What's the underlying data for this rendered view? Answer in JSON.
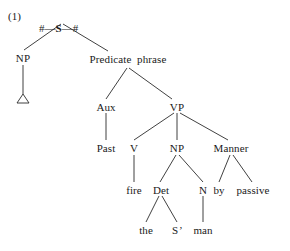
{
  "figure": {
    "number_label": "(1)",
    "root_text": "# — S — #",
    "root_left_boundary": "#",
    "root_symbol": "S",
    "root_right_boundary": "#",
    "dash": "—",
    "type": "syntax-tree",
    "background_color": "#ffffff",
    "line_color": "#2b2b2b",
    "text_color": "#1a1a1a"
  },
  "nodes": {
    "np_subject": "NP",
    "triangle": "△",
    "predicate_phrase": "Predicate  phrase",
    "aux": "Aux",
    "vp": "VP",
    "past": "Past",
    "v": "V",
    "np_object": "NP",
    "manner": "Manner",
    "fire": "fire",
    "det": "Det",
    "n": "N",
    "by": "by",
    "passive": "passive",
    "the": "the",
    "s_prime_s": "S",
    "s_prime_mark": "’",
    "man": "man"
  },
  "tree_structure": {
    "root": "# — S — #",
    "children": [
      {
        "label": "NP",
        "children": [
          {
            "label": "△",
            "children": []
          }
        ]
      },
      {
        "label": "Predicate  phrase",
        "children": [
          {
            "label": "Aux",
            "children": [
              {
                "label": "Past",
                "children": []
              }
            ]
          },
          {
            "label": "VP",
            "children": [
              {
                "label": "V",
                "children": [
                  {
                    "label": "fire",
                    "children": []
                  }
                ]
              },
              {
                "label": "NP",
                "children": [
                  {
                    "label": "Det",
                    "children": [
                      {
                        "label": "the",
                        "children": []
                      },
                      {
                        "label": "S’",
                        "children": []
                      }
                    ]
                  },
                  {
                    "label": "N",
                    "children": [
                      {
                        "label": "man",
                        "children": []
                      }
                    ]
                  }
                ]
              },
              {
                "label": "Manner",
                "children": [
                  {
                    "label": "by",
                    "children": []
                  },
                  {
                    "label": "passive",
                    "children": []
                  }
                ]
              }
            ]
          }
        ]
      }
    ]
  }
}
